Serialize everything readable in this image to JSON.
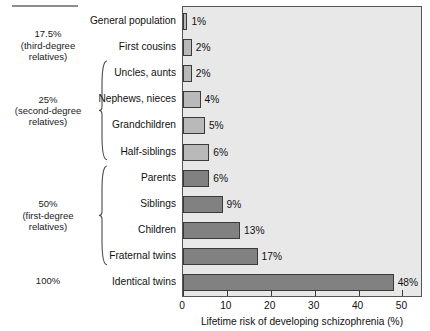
{
  "chart_data": {
    "type": "bar",
    "orientation": "horizontal",
    "title": "",
    "xlabel": "Lifetime risk of developing schizophrenia (%)",
    "ylabel": "",
    "xlim": [
      0,
      54
    ],
    "xticks": [
      0,
      10,
      20,
      30,
      40,
      50
    ],
    "xtick_labels": [
      "0",
      "10",
      "20",
      "30",
      "40",
      "50"
    ],
    "grid": false,
    "legend": null,
    "categories": [
      "General population",
      "First cousins",
      "Uncles, aunts",
      "Nephews, nieces",
      "Grandchildren",
      "Half-siblings",
      "Parents",
      "Siblings",
      "Children",
      "Fraternal twins",
      "Identical twins"
    ],
    "values": [
      1,
      2,
      2,
      4,
      5,
      6,
      6,
      9,
      13,
      17,
      48
    ],
    "value_labels": [
      "1%",
      "2%",
      "2%",
      "4%",
      "5%",
      "6%",
      "6%",
      "9%",
      "13%",
      "17%",
      "48%"
    ],
    "bar_shades": [
      "light",
      "light",
      "light",
      "light",
      "light",
      "light",
      "dark",
      "dark",
      "dark",
      "dark",
      "dark"
    ],
    "colors": {
      "bar_light": "#b9b9b9",
      "bar_dark": "#818181",
      "bar_outline": "#3a3a3a",
      "plot_background": "#e8e8e8",
      "plot_border": "#555555",
      "rule": "#8d8d8d",
      "text": "#111111"
    }
  },
  "groups": [
    {
      "name": "third-degree",
      "percent": "17.5%",
      "line2": "(third-degree",
      "line3": "relatives)",
      "bracket": false,
      "members": [
        "First cousins"
      ]
    },
    {
      "name": "second-degree",
      "percent": "25%",
      "line2": "(second-degree",
      "line3": "relatives)",
      "bracket": true,
      "members": [
        "Uncles, aunts",
        "Nephews, nieces",
        "Grandchildren",
        "Half-siblings"
      ]
    },
    {
      "name": "first-degree",
      "percent": "50%",
      "line2": "(first-degree",
      "line3": "relatives)",
      "bracket": true,
      "members": [
        "Parents",
        "Siblings",
        "Children",
        "Fraternal twins"
      ]
    },
    {
      "name": "identical",
      "percent": "100%",
      "line2": "",
      "line3": "",
      "bracket": false,
      "members": [
        "Identical twins"
      ]
    }
  ]
}
